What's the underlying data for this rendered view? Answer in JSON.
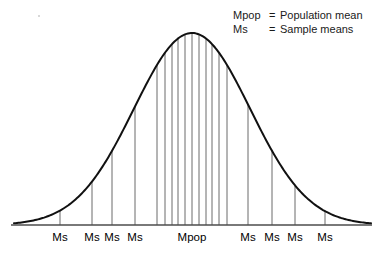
{
  "figure": {
    "legend": [
      {
        "key": "Mpop",
        "eq": "=",
        "desc": "Population mean"
      },
      {
        "key": "Ms",
        "eq": "=",
        "desc": "Sample means"
      }
    ],
    "colors": {
      "curve": "#111111",
      "ordinate": "#5a5a5a",
      "axis": "#4d4d4d",
      "text": "#000000",
      "background": "#ffffff"
    }
  },
  "chart_data": {
    "type": "line",
    "title": "",
    "subtitle": "",
    "xlabel": "",
    "ylabel": "",
    "grid": false,
    "legend_position": "top-right",
    "annotations": [
      "Mpop = Population mean",
      "Ms = Sample means"
    ],
    "curve": {
      "name": "Normal distribution of sample means",
      "distribution": "gaussian",
      "mean_x": 192,
      "sigma_px": 58,
      "peak_y": 33,
      "baseline_y": 225,
      "x_start": 14,
      "x_end": 371
    },
    "axis": {
      "x_start": 11,
      "x_end": 372,
      "y": 225,
      "visible": true
    },
    "x_tick_labels": [
      {
        "label": "Ms",
        "x": 60
      },
      {
        "label": "Ms",
        "x": 92
      },
      {
        "label": "Ms",
        "x": 112
      },
      {
        "label": "Ms",
        "x": 135
      },
      {
        "label": "Mpop",
        "x": 192
      },
      {
        "label": "Ms",
        "x": 248
      },
      {
        "label": "Ms",
        "x": 272
      },
      {
        "label": "Ms",
        "x": 295
      },
      {
        "label": "Ms",
        "x": 325
      }
    ],
    "ordinates_x": [
      60,
      92,
      112,
      135,
      157,
      165,
      172,
      178,
      185,
      192,
      199,
      206,
      212,
      219,
      227,
      248,
      272,
      295,
      325
    ],
    "labeled_ordinates_x": [
      60,
      92,
      112,
      135,
      192,
      248,
      272,
      295,
      325
    ],
    "ordinate_count": 19
  }
}
